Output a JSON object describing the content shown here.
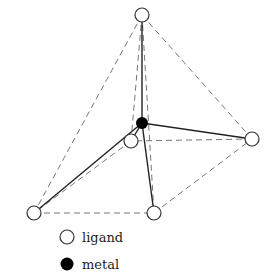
{
  "diagram": {
    "type": "square-pyramidal coordination geometry",
    "nodes": [
      {
        "id": "top",
        "kind": "ligand",
        "x": 142,
        "y": 15
      },
      {
        "id": "back",
        "kind": "ligand",
        "x": 131,
        "y": 141
      },
      {
        "id": "right",
        "kind": "ligand",
        "x": 252,
        "y": 139
      },
      {
        "id": "bottom_left",
        "kind": "ligand",
        "x": 34,
        "y": 213
      },
      {
        "id": "bottom_right",
        "kind": "ligand",
        "x": 154,
        "y": 213
      },
      {
        "id": "center",
        "kind": "metal",
        "x": 142,
        "y": 123
      }
    ],
    "bonds_solid": [
      [
        "center",
        "top"
      ],
      [
        "center",
        "back"
      ],
      [
        "center",
        "right"
      ],
      [
        "center",
        "bottom_left"
      ],
      [
        "center",
        "bottom_right"
      ]
    ],
    "edges_dashed": [
      [
        "top",
        "back"
      ],
      [
        "top",
        "right"
      ],
      [
        "top",
        "bottom_left"
      ],
      [
        "top",
        "bottom_right"
      ],
      [
        "bottom_left",
        "bottom_right"
      ],
      [
        "bottom_right",
        "right"
      ],
      [
        "right",
        "back"
      ],
      [
        "back",
        "bottom_left"
      ]
    ]
  },
  "legend": {
    "items": [
      {
        "symbol": "open-circle",
        "label": "ligand"
      },
      {
        "symbol": "filled-circle",
        "label": "metal"
      }
    ]
  },
  "colors": {
    "line": "#333333",
    "dashed": "#777777",
    "metal": "#000000",
    "ligand_fill": "#ffffff"
  }
}
